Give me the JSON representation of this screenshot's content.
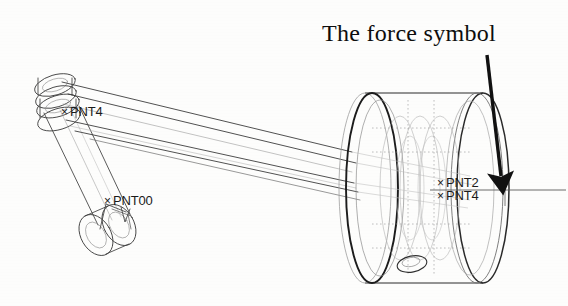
{
  "figure": {
    "kind": "cad-wireframe-diagram",
    "background_color": "#fdfdfc",
    "line_color": "#3a3a3a",
    "hidden_line_color": "#9a9a9a",
    "annotation_color": "#0d0d0d"
  },
  "annotation": {
    "title": "The force symbol",
    "title_x": 322,
    "title_y": 20,
    "arrow": {
      "name": "force-arrow",
      "start_x": 487,
      "start_y": 55,
      "end_x": 501,
      "end_y": 180,
      "color": "#111111",
      "width": 3.6
    }
  },
  "point_labels": [
    {
      "id": "pnt4-left",
      "text": "PNT4",
      "marker": "×",
      "x": 70,
      "y": 112,
      "marker_x": 61,
      "marker_y": 112
    },
    {
      "id": "pnt00",
      "text": "PNT00",
      "marker": "×",
      "x": 113,
      "y": 201,
      "marker_x": 104,
      "marker_y": 201
    },
    {
      "id": "pnt2-right",
      "text": "PNT2",
      "marker": "×",
      "x": 446,
      "y": 183,
      "marker_x": 437,
      "marker_y": 183
    },
    {
      "id": "pnt4-right",
      "text": "PNT4",
      "marker": "×",
      "x": 446,
      "y": 196,
      "marker_x": 437,
      "marker_y": 196
    }
  ],
  "geometry": {
    "drum": {
      "name": "drum-wheel-assembly",
      "left_rim_center_x": 365,
      "left_rim_center_y": 188,
      "right_rim_center_x": 483,
      "right_rim_center_y": 188,
      "rim_rx": 26,
      "rim_ry": 95,
      "small_hole_x": 412,
      "small_hole_y": 264
    },
    "axis_line": {
      "name": "horizontal-datum-axis",
      "x1": 430,
      "y1": 190,
      "x2": 566,
      "y2": 190,
      "tick_x": 505
    },
    "arm": {
      "name": "crank-arm-linkage",
      "clevis_x": 62,
      "clevis_y": 100,
      "hub_x": 105,
      "hub_y": 230
    }
  }
}
